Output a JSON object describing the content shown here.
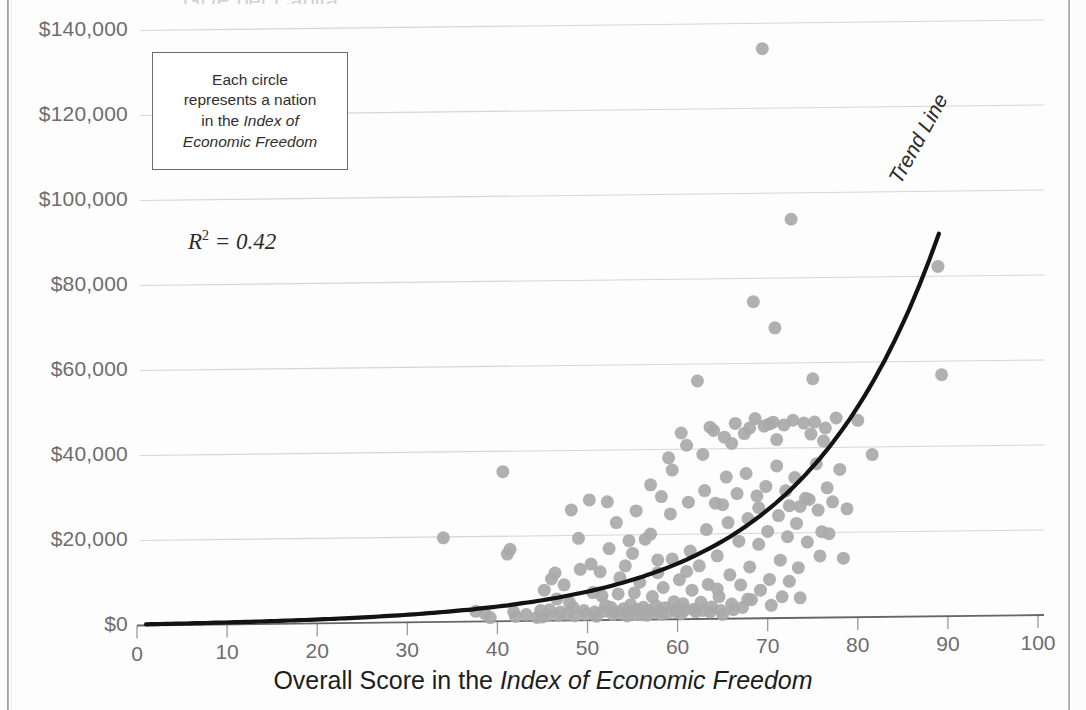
{
  "chart_data": {
    "type": "scatter",
    "title": "",
    "xlabel_parts": {
      "plain": "Overall Score in the ",
      "italic": "Index of Economic Freedom"
    },
    "ylabel": "",
    "xlim": [
      0,
      100
    ],
    "ylim": [
      0,
      140000
    ],
    "grid": true,
    "legend_position": "none",
    "x_ticks": [
      0,
      10,
      20,
      30,
      40,
      50,
      60,
      70,
      80,
      90,
      100
    ],
    "x_tick_labels": [
      "0",
      "10",
      "20",
      "30",
      "40",
      "50",
      "60",
      "70",
      "80",
      "90",
      "100"
    ],
    "y_ticks": [
      0,
      20000,
      40000,
      60000,
      80000,
      100000,
      120000,
      140000
    ],
    "y_tick_labels": [
      "$0",
      "$20,000",
      "$40,000",
      "$60,000",
      "$80,000",
      "$100,000",
      "$120,000",
      "$140,000"
    ],
    "marker_color": "#a9a9a9",
    "marker_radius_px": 6.5,
    "trendline": {
      "label": "Trend Line",
      "type": "exponential",
      "color": "#131313",
      "r_squared": 0.42,
      "r_squared_text": "R² = 0.42",
      "x_start": 1,
      "x_end": 89,
      "y_at_x_end": 90000
    },
    "annotations": [
      {
        "name": "callout",
        "lines": [
          "Each circle",
          "represents a nation",
          "in the Index of",
          "Economic Freedom"
        ],
        "italic_part": "Index of Economic Freedom"
      }
    ],
    "points": [
      [
        34.0,
        19800
      ],
      [
        37.6,
        2400
      ],
      [
        38.6,
        1900
      ],
      [
        39.2,
        900
      ],
      [
        40.6,
        35200
      ],
      [
        41.1,
        15800
      ],
      [
        41.4,
        16900
      ],
      [
        41.8,
        2200
      ],
      [
        42.0,
        1100
      ],
      [
        43.2,
        1500
      ],
      [
        44.4,
        800
      ],
      [
        45.0,
        900
      ],
      [
        45.2,
        7200
      ],
      [
        45.6,
        1300
      ],
      [
        45.8,
        2600
      ],
      [
        46.0,
        9800
      ],
      [
        46.4,
        11200
      ],
      [
        46.8,
        1200
      ],
      [
        47.0,
        2000
      ],
      [
        47.4,
        8400
      ],
      [
        47.8,
        1500
      ],
      [
        48.2,
        26000
      ],
      [
        48.4,
        3100
      ],
      [
        48.6,
        1100
      ],
      [
        49.0,
        19300
      ],
      [
        49.2,
        12000
      ],
      [
        49.6,
        2300
      ],
      [
        49.8,
        1400
      ],
      [
        50.2,
        28300
      ],
      [
        50.4,
        13200
      ],
      [
        50.8,
        1900
      ],
      [
        51.0,
        900
      ],
      [
        51.4,
        11400
      ],
      [
        51.6,
        5700
      ],
      [
        51.8,
        2100
      ],
      [
        52.2,
        27800
      ],
      [
        52.4,
        16800
      ],
      [
        52.6,
        3000
      ],
      [
        52.8,
        1300
      ],
      [
        53.0,
        2000
      ],
      [
        53.4,
        6100
      ],
      [
        53.6,
        9900
      ],
      [
        53.8,
        1500
      ],
      [
        54.0,
        2600
      ],
      [
        54.2,
        12700
      ],
      [
        54.4,
        900
      ],
      [
        54.6,
        1800
      ],
      [
        54.8,
        3500
      ],
      [
        55.0,
        15600
      ],
      [
        55.2,
        6300
      ],
      [
        55.4,
        1200
      ],
      [
        55.6,
        2400
      ],
      [
        55.8,
        8800
      ],
      [
        56.0,
        1400
      ],
      [
        56.2,
        2900
      ],
      [
        56.4,
        18900
      ],
      [
        56.6,
        1000
      ],
      [
        56.8,
        2200
      ],
      [
        57.0,
        31700
      ],
      [
        57.2,
        5400
      ],
      [
        57.4,
        1600
      ],
      [
        57.6,
        3200
      ],
      [
        57.8,
        11000
      ],
      [
        58.0,
        2000
      ],
      [
        58.2,
        1200
      ],
      [
        58.4,
        7500
      ],
      [
        58.6,
        2700
      ],
      [
        58.8,
        1500
      ],
      [
        59.0,
        38000
      ],
      [
        59.2,
        24800
      ],
      [
        59.4,
        14200
      ],
      [
        59.6,
        4100
      ],
      [
        59.8,
        1800
      ],
      [
        60.0,
        2500
      ],
      [
        60.2,
        9300
      ],
      [
        60.4,
        1300
      ],
      [
        60.6,
        3600
      ],
      [
        60.8,
        2100
      ],
      [
        61.0,
        40900
      ],
      [
        61.2,
        27500
      ],
      [
        61.4,
        16000
      ],
      [
        61.6,
        6800
      ],
      [
        61.8,
        2300
      ],
      [
        62.0,
        1700
      ],
      [
        62.2,
        56000
      ],
      [
        62.4,
        12500
      ],
      [
        62.6,
        3900
      ],
      [
        62.8,
        2000
      ],
      [
        63.0,
        30200
      ],
      [
        63.2,
        21000
      ],
      [
        63.4,
        8100
      ],
      [
        63.6,
        1600
      ],
      [
        63.8,
        2800
      ],
      [
        64.0,
        44300
      ],
      [
        64.2,
        27200
      ],
      [
        64.4,
        14800
      ],
      [
        64.6,
        5200
      ],
      [
        64.8,
        1900
      ],
      [
        65.0,
        1000
      ],
      [
        65.2,
        42700
      ],
      [
        65.4,
        33300
      ],
      [
        65.6,
        22600
      ],
      [
        65.8,
        10300
      ],
      [
        66.0,
        3400
      ],
      [
        66.2,
        2100
      ],
      [
        66.4,
        45900
      ],
      [
        66.6,
        29400
      ],
      [
        66.8,
        18200
      ],
      [
        67.0,
        7900
      ],
      [
        67.2,
        2600
      ],
      [
        67.4,
        43500
      ],
      [
        67.6,
        34100
      ],
      [
        67.8,
        23500
      ],
      [
        68.0,
        12100
      ],
      [
        68.2,
        4400
      ],
      [
        68.4,
        74500
      ],
      [
        68.6,
        47000
      ],
      [
        68.8,
        28800
      ],
      [
        69.0,
        17400
      ],
      [
        69.2,
        6600
      ],
      [
        69.4,
        134000
      ],
      [
        69.6,
        45200
      ],
      [
        69.8,
        31000
      ],
      [
        70.0,
        20400
      ],
      [
        70.2,
        9100
      ],
      [
        70.4,
        3000
      ],
      [
        70.6,
        46100
      ],
      [
        70.8,
        68300
      ],
      [
        71.0,
        35800
      ],
      [
        71.2,
        24100
      ],
      [
        71.4,
        13600
      ],
      [
        71.6,
        5000
      ],
      [
        71.8,
        45400
      ],
      [
        72.0,
        29900
      ],
      [
        72.2,
        19100
      ],
      [
        72.4,
        8600
      ],
      [
        72.6,
        93800
      ],
      [
        72.8,
        46500
      ],
      [
        73.0,
        33000
      ],
      [
        73.2,
        22200
      ],
      [
        73.4,
        11800
      ],
      [
        73.6,
        4700
      ],
      [
        74.0,
        45800
      ],
      [
        74.2,
        28100
      ],
      [
        74.4,
        17800
      ],
      [
        74.6,
        27800
      ],
      [
        75.0,
        56200
      ],
      [
        75.2,
        46000
      ],
      [
        75.4,
        36200
      ],
      [
        75.6,
        25300
      ],
      [
        75.8,
        14500
      ],
      [
        76.0,
        20200
      ],
      [
        76.4,
        44600
      ],
      [
        76.6,
        30500
      ],
      [
        76.8,
        19700
      ],
      [
        77.2,
        27200
      ],
      [
        77.6,
        46900
      ],
      [
        78.0,
        34800
      ],
      [
        78.4,
        13900
      ],
      [
        80.0,
        46300
      ],
      [
        81.6,
        38200
      ],
      [
        88.9,
        82300
      ],
      [
        89.3,
        56800
      ],
      [
        72.4,
        26400
      ],
      [
        59.4,
        35100
      ],
      [
        62.8,
        38700
      ],
      [
        66.0,
        41200
      ],
      [
        57.0,
        20100
      ],
      [
        53.2,
        22900
      ],
      [
        50.6,
        6500
      ],
      [
        48.0,
        4200
      ],
      [
        44.8,
        2400
      ],
      [
        61.0,
        11200
      ],
      [
        64.4,
        7000
      ],
      [
        67.8,
        4500
      ],
      [
        70.2,
        45700
      ],
      [
        55.4,
        25600
      ],
      [
        58.2,
        28900
      ],
      [
        52.0,
        3400
      ],
      [
        46.6,
        5100
      ],
      [
        63.6,
        45100
      ],
      [
        68.0,
        44800
      ],
      [
        71.0,
        42000
      ],
      [
        74.8,
        43200
      ],
      [
        60.4,
        43800
      ],
      [
        65.0,
        26800
      ],
      [
        69.0,
        26000
      ],
      [
        73.6,
        26200
      ],
      [
        76.2,
        41500
      ],
      [
        78.8,
        25500
      ],
      [
        57.8,
        14000
      ],
      [
        54.6,
        18600
      ]
    ]
  },
  "axis": {
    "y_labels": [
      "$140,000",
      "$120,000",
      "$100,000",
      "$80,000",
      "$60,000",
      "$40,000",
      "$20,000",
      "$0"
    ],
    "x_labels": [
      "0",
      "10",
      "20",
      "30",
      "40",
      "50",
      "60",
      "70",
      "80",
      "90",
      "100"
    ]
  },
  "callout": {
    "line1": "Each circle",
    "line2": "represents a nation",
    "line3_plain": "in the ",
    "line3_italic": "Index of",
    "line4_italic": "Economic Freedom"
  },
  "rsquared": {
    "prefix": "R",
    "sup": "2",
    "rest": " = 0.42"
  },
  "trend": {
    "label": "Trend Line"
  },
  "xtitle": {
    "plain": "Overall Score in the ",
    "italic": "Index of Economic Freedom"
  },
  "cut_title": {
    "text": "GDP per Capita"
  }
}
